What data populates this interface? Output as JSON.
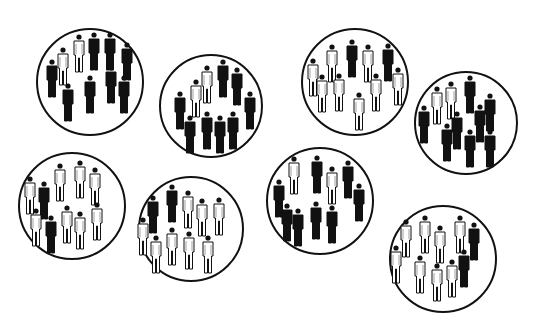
{
  "illustration": {
    "description": "Eight circular groups of human figures, each group mostly black or mostly white figures with a minority of the other color",
    "colors": {
      "black_figure": "#111111",
      "white_figure": "#ffffff",
      "outline": "#111111",
      "background": "#ffffff"
    },
    "groups": [
      {
        "id": "group-1",
        "cx": 90,
        "cy": 82,
        "r": 54,
        "majority": "black",
        "black_count": 8,
        "white_count": 2,
        "figures": [
          {
            "x": 52,
            "y": 62,
            "c": "black"
          },
          {
            "x": 63,
            "y": 50,
            "c": "white"
          },
          {
            "x": 79,
            "y": 37,
            "c": "white"
          },
          {
            "x": 94,
            "y": 35,
            "c": "black"
          },
          {
            "x": 110,
            "y": 35,
            "c": "black"
          },
          {
            "x": 127,
            "y": 45,
            "c": "black"
          },
          {
            "x": 111,
            "y": 68,
            "c": "black"
          },
          {
            "x": 124,
            "y": 78,
            "c": "black"
          },
          {
            "x": 90,
            "y": 78,
            "c": "black"
          },
          {
            "x": 68,
            "y": 86,
            "c": "black"
          }
        ]
      },
      {
        "id": "group-2",
        "cx": 211,
        "cy": 106,
        "r": 52,
        "majority": "black",
        "black_count": 9,
        "white_count": 2,
        "figures": [
          {
            "x": 180,
            "y": 94,
            "c": "black"
          },
          {
            "x": 196,
            "y": 82,
            "c": "white"
          },
          {
            "x": 207,
            "y": 68,
            "c": "white"
          },
          {
            "x": 223,
            "y": 62,
            "c": "black"
          },
          {
            "x": 237,
            "y": 70,
            "c": "black"
          },
          {
            "x": 250,
            "y": 94,
            "c": "black"
          },
          {
            "x": 190,
            "y": 118,
            "c": "black"
          },
          {
            "x": 207,
            "y": 114,
            "c": "black"
          },
          {
            "x": 220,
            "y": 118,
            "c": "black"
          },
          {
            "x": 233,
            "y": 114,
            "c": "black"
          }
        ]
      },
      {
        "id": "group-3",
        "cx": 355,
        "cy": 82,
        "r": 54,
        "majority": "white",
        "black_count": 2,
        "white_count": 9,
        "figures": [
          {
            "x": 313,
            "y": 61,
            "c": "white"
          },
          {
            "x": 332,
            "y": 47,
            "c": "white"
          },
          {
            "x": 352,
            "y": 42,
            "c": "black"
          },
          {
            "x": 368,
            "y": 47,
            "c": "white"
          },
          {
            "x": 388,
            "y": 46,
            "c": "black"
          },
          {
            "x": 398,
            "y": 70,
            "c": "white"
          },
          {
            "x": 322,
            "y": 77,
            "c": "white"
          },
          {
            "x": 339,
            "y": 76,
            "c": "white"
          },
          {
            "x": 376,
            "y": 76,
            "c": "white"
          },
          {
            "x": 359,
            "y": 95,
            "c": "white"
          }
        ]
      },
      {
        "id": "group-4",
        "cx": 466,
        "cy": 123,
        "r": 52,
        "majority": "black",
        "black_count": 9,
        "white_count": 2,
        "figures": [
          {
            "x": 424,
            "y": 108,
            "c": "black"
          },
          {
            "x": 437,
            "y": 89,
            "c": "white"
          },
          {
            "x": 451,
            "y": 84,
            "c": "white"
          },
          {
            "x": 470,
            "y": 78,
            "c": "black"
          },
          {
            "x": 490,
            "y": 96,
            "c": "black"
          },
          {
            "x": 480,
            "y": 107,
            "c": "black"
          },
          {
            "x": 457,
            "y": 114,
            "c": "black"
          },
          {
            "x": 447,
            "y": 126,
            "c": "black"
          },
          {
            "x": 470,
            "y": 132,
            "c": "black"
          },
          {
            "x": 490,
            "y": 132,
            "c": "black"
          }
        ]
      },
      {
        "id": "group-5",
        "cx": 72,
        "cy": 206,
        "r": 54,
        "majority": "white",
        "black_count": 2,
        "white_count": 9,
        "figures": [
          {
            "x": 30,
            "y": 179,
            "c": "white"
          },
          {
            "x": 44,
            "y": 184,
            "c": "black"
          },
          {
            "x": 60,
            "y": 166,
            "c": "white"
          },
          {
            "x": 80,
            "y": 163,
            "c": "white"
          },
          {
            "x": 95,
            "y": 170,
            "c": "white"
          },
          {
            "x": 36,
            "y": 211,
            "c": "white"
          },
          {
            "x": 51,
            "y": 218,
            "c": "black"
          },
          {
            "x": 67,
            "y": 208,
            "c": "white"
          },
          {
            "x": 80,
            "y": 214,
            "c": "white"
          },
          {
            "x": 97,
            "y": 205,
            "c": "white"
          }
        ]
      },
      {
        "id": "group-6",
        "cx": 191,
        "cy": 229,
        "r": 53,
        "majority": "white",
        "black_count": 2,
        "white_count": 9,
        "figures": [
          {
            "x": 153,
            "y": 198,
            "c": "black"
          },
          {
            "x": 172,
            "y": 187,
            "c": "black"
          },
          {
            "x": 188,
            "y": 193,
            "c": "white"
          },
          {
            "x": 202,
            "y": 201,
            "c": "white"
          },
          {
            "x": 219,
            "y": 200,
            "c": "white"
          },
          {
            "x": 143,
            "y": 220,
            "c": "white"
          },
          {
            "x": 156,
            "y": 238,
            "c": "white"
          },
          {
            "x": 172,
            "y": 230,
            "c": "white"
          },
          {
            "x": 189,
            "y": 234,
            "c": "white"
          },
          {
            "x": 208,
            "y": 238,
            "c": "white"
          }
        ]
      },
      {
        "id": "group-7",
        "cx": 320,
        "cy": 201,
        "r": 54,
        "majority": "black",
        "black_count": 9,
        "white_count": 2,
        "figures": [
          {
            "x": 279,
            "y": 182,
            "c": "black"
          },
          {
            "x": 294,
            "y": 159,
            "c": "white"
          },
          {
            "x": 317,
            "y": 158,
            "c": "black"
          },
          {
            "x": 332,
            "y": 169,
            "c": "white"
          },
          {
            "x": 348,
            "y": 163,
            "c": "black"
          },
          {
            "x": 359,
            "y": 186,
            "c": "black"
          },
          {
            "x": 287,
            "y": 206,
            "c": "black"
          },
          {
            "x": 298,
            "y": 211,
            "c": "black"
          },
          {
            "x": 316,
            "y": 204,
            "c": "black"
          },
          {
            "x": 332,
            "y": 208,
            "c": "black"
          }
        ]
      },
      {
        "id": "group-8",
        "cx": 443,
        "cy": 259,
        "r": 54,
        "majority": "white",
        "black_count": 2,
        "white_count": 8,
        "figures": [
          {
            "x": 406,
            "y": 222,
            "c": "white"
          },
          {
            "x": 425,
            "y": 218,
            "c": "white"
          },
          {
            "x": 440,
            "y": 228,
            "c": "white"
          },
          {
            "x": 460,
            "y": 218,
            "c": "white"
          },
          {
            "x": 474,
            "y": 225,
            "c": "black"
          },
          {
            "x": 396,
            "y": 248,
            "c": "white"
          },
          {
            "x": 420,
            "y": 258,
            "c": "white"
          },
          {
            "x": 437,
            "y": 266,
            "c": "white"
          },
          {
            "x": 452,
            "y": 262,
            "c": "white"
          },
          {
            "x": 464,
            "y": 252,
            "c": "black"
          }
        ]
      }
    ]
  }
}
